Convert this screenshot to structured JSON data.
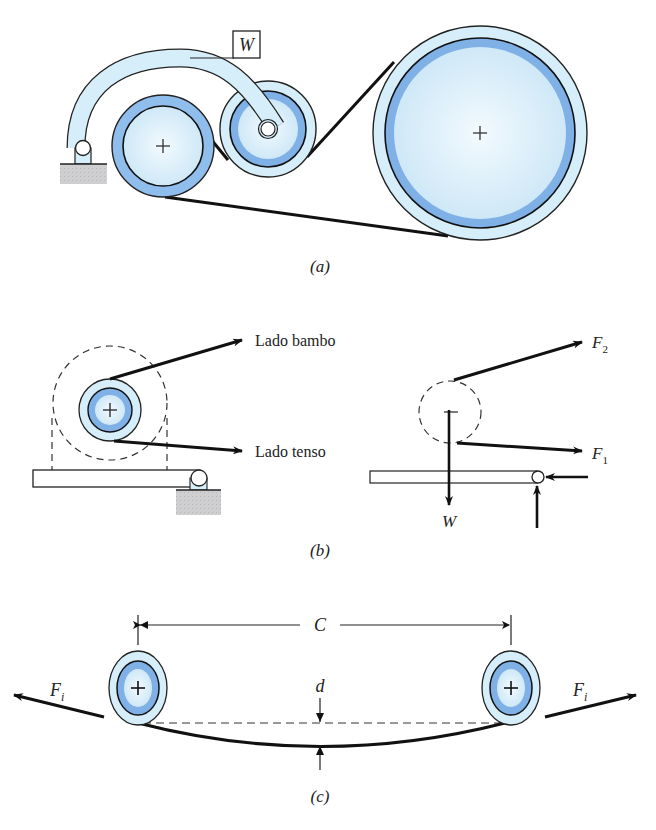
{
  "figure": {
    "panels": [
      {
        "id": "a",
        "caption": "(a)",
        "weight_label": "W"
      },
      {
        "id": "b",
        "caption": "(b)",
        "slack_side_label": "Lado bambo",
        "tight_side_label": "Lado tenso",
        "force_labels": {
          "f2": "F",
          "f2_sub": "2",
          "f1": "F",
          "f1_sub": "1",
          "weight": "W"
        }
      },
      {
        "id": "c",
        "caption": "(c)",
        "center_distance_label": "C",
        "sag_label": "d",
        "initial_tension_left": "F",
        "initial_tension_left_sub": "i",
        "initial_tension_right": "F",
        "initial_tension_right_sub": "i"
      }
    ],
    "colors": {
      "pulley_light": "#d6eef9",
      "pulley_band": "#7fb0e6",
      "pulley_core": "#e6f4fb",
      "ground": "#c9c9cc",
      "stroke": "#1a1a1a"
    }
  }
}
